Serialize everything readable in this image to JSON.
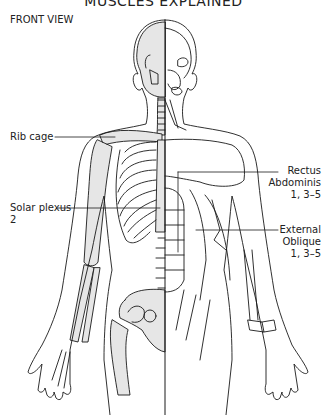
{
  "header": {
    "title": "MUSCLES EXPLAINED",
    "view_label": "FRONT VIEW"
  },
  "labels": {
    "rib_cage": {
      "line1": "Rib cage"
    },
    "solar_plexus": {
      "line1": "Solar plexus",
      "line2": "2"
    },
    "rectus_abdominis": {
      "line1": "Rectus",
      "line2": "Abdominis",
      "line3": "1, 3–5"
    },
    "external_oblique": {
      "line1": "External",
      "line2": "Oblique",
      "line3": "1, 3–5"
    }
  },
  "colors": {
    "bone_fill": "#e6e6e6",
    "outline": "#1a1a1a",
    "background": "#ffffff"
  }
}
